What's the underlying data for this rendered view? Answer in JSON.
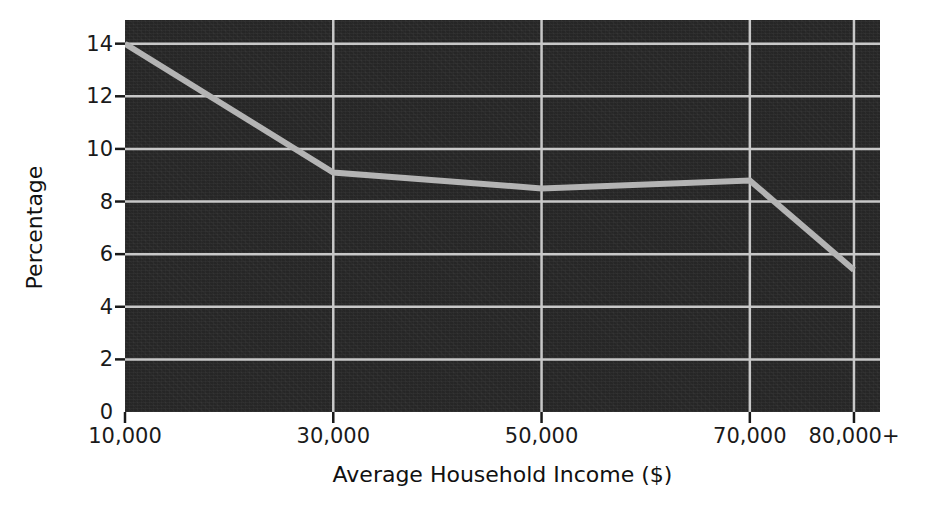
{
  "chart_data": {
    "type": "line",
    "title": "",
    "subtitle": "",
    "xlabel": "Average Household Income ($)",
    "ylabel": "Percentage",
    "categories": [
      "10,000",
      "30,000",
      "50,000",
      "70,000",
      "80,000+"
    ],
    "x": [
      10000,
      30000,
      50000,
      70000,
      80000
    ],
    "values": [
      14.0,
      9.1,
      8.5,
      8.8,
      5.4
    ],
    "series": [
      {
        "name": "Percentage",
        "values": [
          14.0,
          9.1,
          8.5,
          8.8,
          5.4
        ],
        "color": "#b4b4b4"
      }
    ],
    "xtick_labels": [
      "10,000",
      "30,000",
      "50,000",
      "70,000",
      "80,000+"
    ],
    "ytick_labels": [
      "0",
      "2",
      "4",
      "6",
      "8",
      "10",
      "12",
      "14"
    ],
    "ytick_values": [
      0,
      2,
      4,
      6,
      8,
      10,
      12,
      14
    ],
    "ylim": [
      0,
      14.9
    ],
    "xlim": [
      10000,
      82500
    ],
    "grid": true,
    "grid_color": "#c8c8c8",
    "legend": false,
    "legend_position": "none",
    "plot_background": "#262626",
    "figure_background": "#ffffff",
    "annotations": []
  },
  "axes": {
    "y": {
      "title": "Percentage",
      "ticks": [
        {
          "label": "14",
          "value": 14
        },
        {
          "label": "12",
          "value": 12
        },
        {
          "label": "10",
          "value": 10
        },
        {
          "label": "8",
          "value": 8
        },
        {
          "label": "6",
          "value": 6
        },
        {
          "label": "4",
          "value": 4
        },
        {
          "label": "2",
          "value": 2
        },
        {
          "label": "0",
          "value": 0
        }
      ]
    },
    "x": {
      "title": "Average Household Income ($)",
      "ticks": [
        {
          "label": "10,000",
          "value": 10000
        },
        {
          "label": "30,000",
          "value": 30000
        },
        {
          "label": "50,000",
          "value": 50000
        },
        {
          "label": "70,000",
          "value": 70000
        },
        {
          "label": "80,000+",
          "value": 80000
        }
      ]
    }
  }
}
